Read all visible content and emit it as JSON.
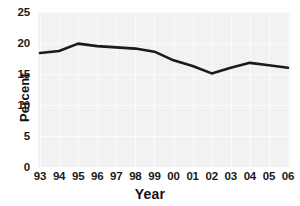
{
  "chart_data": {
    "type": "line",
    "title": "",
    "xlabel": "Year",
    "ylabel": "Percent",
    "categories": [
      "93",
      "94",
      "95",
      "96",
      "97",
      "98",
      "99",
      "00",
      "01",
      "02",
      "03",
      "04",
      "05",
      "06"
    ],
    "values": [
      18.4,
      18.7,
      19.9,
      19.5,
      19.3,
      19.1,
      18.6,
      17.2,
      16.3,
      15.1,
      16.0,
      16.8,
      16.4,
      16.0
    ],
    "series": [
      {
        "name": "Percent",
        "values": [
          18.4,
          18.7,
          19.9,
          19.5,
          19.3,
          19.1,
          18.6,
          17.2,
          16.3,
          15.1,
          16.0,
          16.8,
          16.4,
          16.0
        ]
      }
    ],
    "ylim": [
      0,
      25
    ],
    "yticks": [
      0,
      5,
      10,
      15,
      20,
      25
    ],
    "ytick_labels": [
      "0",
      "5",
      "10",
      "15",
      "20",
      "25"
    ],
    "xtick_labels": [
      "93",
      "94",
      "95",
      "96",
      "97",
      "98",
      "99",
      "00",
      "01",
      "02",
      "03",
      "04",
      "05",
      "06"
    ],
    "grid": true,
    "legend": "none",
    "line_color": "#1a1a1a",
    "line_width": 2.6,
    "plot_background": "#f2f2f2",
    "gridline_color": "#fbfbfb",
    "figure_background": "#ffffff"
  }
}
